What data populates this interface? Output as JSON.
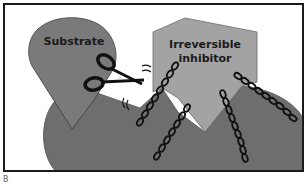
{
  "diagram": {
    "labels": {
      "substrate": "Substrate",
      "inhibitor_line1": "Irreversible",
      "inhibitor_line2": "inhibitor",
      "panel": "B"
    },
    "elements": [
      {
        "name": "enzyme",
        "shape": "rounded blob with two pockets",
        "color": "#6e6e6e"
      },
      {
        "name": "substrate",
        "shape": "teardrop pointing down",
        "color": "#7a7a7a"
      },
      {
        "name": "irreversible-inhibitor",
        "shape": "pentagon with V-notch bottom",
        "color": "#a3a3a3"
      },
      {
        "name": "scissors",
        "shape": "scissors icon",
        "color": "#111111"
      },
      {
        "name": "chains",
        "count": 4,
        "color": "#111111"
      }
    ],
    "colors": {
      "enzyme": "#6e6e6e",
      "substrate": "#7a7a7a",
      "inhibitor": "#a3a3a3",
      "outline": "#1a1a1a",
      "background": "#ffffff"
    }
  }
}
